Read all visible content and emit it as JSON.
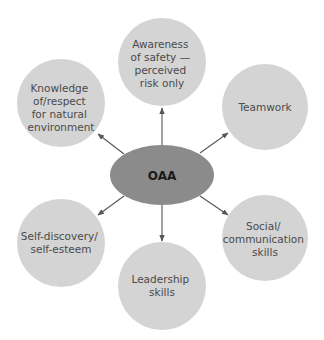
{
  "diagram": {
    "type": "hub-and-spoke",
    "colors": {
      "background": "#ffffff",
      "node_fill": "#d4d4d4",
      "hub_fill": "#8b8b8b",
      "arrow": "#555555",
      "node_text": "#4a4a4a",
      "hub_text": "#1a1a1a"
    },
    "hub": {
      "label": "OAA"
    },
    "nodes": [
      {
        "id": "awareness",
        "lines": [
          "Awareness",
          "of safety —",
          "perceived",
          "risk only"
        ]
      },
      {
        "id": "teamwork",
        "lines": [
          "Teamwork"
        ]
      },
      {
        "id": "social",
        "lines": [
          "Social/",
          "communication",
          "skills"
        ]
      },
      {
        "id": "leadership",
        "lines": [
          "Leadership",
          "skills"
        ]
      },
      {
        "id": "self-discovery",
        "lines": [
          "Self-discovery/",
          "self-esteem"
        ]
      },
      {
        "id": "knowledge",
        "lines": [
          "Knowledge",
          "of/respect",
          "for natural",
          "environment"
        ]
      }
    ],
    "edges": [
      {
        "from": "OAA",
        "to": "awareness"
      },
      {
        "from": "OAA",
        "to": "teamwork"
      },
      {
        "from": "OAA",
        "to": "social"
      },
      {
        "from": "OAA",
        "to": "leadership"
      },
      {
        "from": "OAA",
        "to": "self-discovery"
      },
      {
        "from": "OAA",
        "to": "knowledge"
      }
    ]
  }
}
